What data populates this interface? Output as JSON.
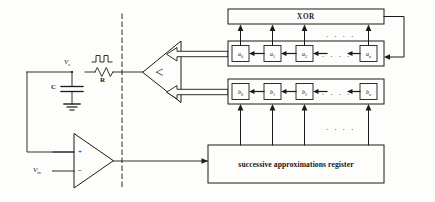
{
  "figure": {
    "type": "block-diagram",
    "background_color": "#fdfdfb",
    "line_color": "#1a1a1a",
    "divider": {
      "name": "dashed-vertical-divider",
      "style": "dashed",
      "x_pct": 28
    }
  },
  "analog_section": {
    "capacitor": {
      "label": "C",
      "name": "capacitor-C"
    },
    "resistor": {
      "label": "R",
      "name": "resistor-R"
    },
    "node_voltage": {
      "label": "V",
      "sub": "c",
      "name": "node-voltage-vc"
    },
    "input_voltage": {
      "label": "V",
      "sub": "in",
      "name": "input-voltage-vin"
    },
    "ground": {
      "name": "ground-symbol"
    },
    "pulse_waveform": {
      "name": "pulse-waveform-icon"
    },
    "opamp": {
      "name": "operational-amplifier",
      "plus": "+",
      "minus": "−"
    }
  },
  "comparator": {
    "name": "comparator-block",
    "glyph": "<",
    "orientation": "points-left",
    "inputs": [
      {
        "name": "comparator-input-arrow-upper",
        "from": "a-register"
      },
      {
        "name": "comparator-input-arrow-lower",
        "from": "b-register"
      }
    ]
  },
  "xor_block": {
    "name": "xor-block",
    "label": "XOR"
  },
  "registers": [
    {
      "name": "a-register-row",
      "id": "a",
      "cells": [
        {
          "base": "a",
          "sub": "0"
        },
        {
          "base": "a",
          "sub": "1"
        },
        {
          "base": "a",
          "sub": "2"
        },
        {
          "base": "a",
          "sub": "n"
        }
      ],
      "ellipsis": ". . . .",
      "chain_direction": "right-to-left"
    },
    {
      "name": "b-register-row",
      "id": "b",
      "cells": [
        {
          "base": "b",
          "sub": "0"
        },
        {
          "base": "b",
          "sub": "1"
        },
        {
          "base": "b",
          "sub": "2"
        },
        {
          "base": "b",
          "sub": "n"
        }
      ],
      "ellipsis": ". . . .",
      "chain_direction": "right-to-left"
    }
  ],
  "xor_taps_ellipsis": ". . . .",
  "sar_taps_ellipsis": ". . . .",
  "sar": {
    "name": "successive-approximations-register",
    "label": "successive approximations register"
  },
  "feedback": {
    "name": "xor-feedback-path",
    "from": "xor-block-output-right",
    "to": "a-register-row-right"
  }
}
